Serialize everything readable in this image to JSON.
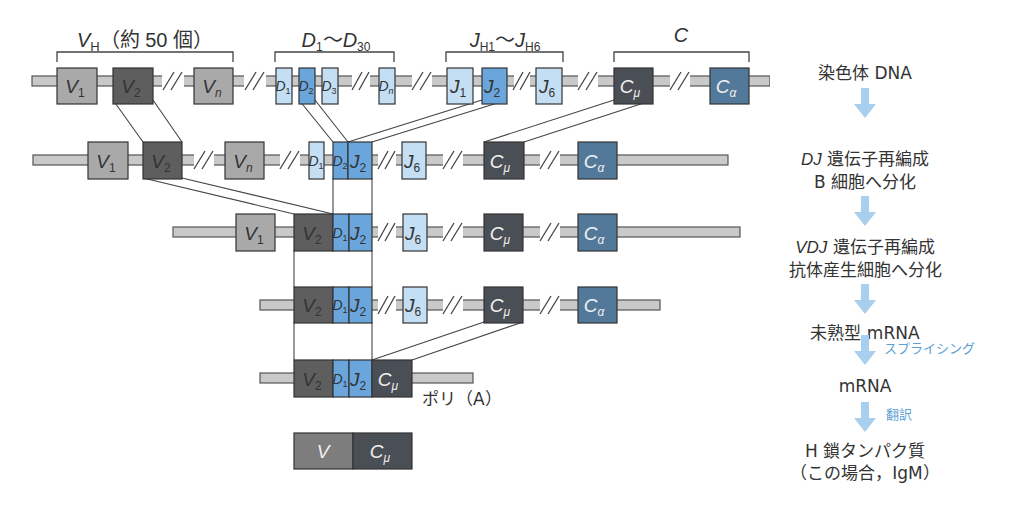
{
  "figure": {
    "type": "immunoglobulin heavy chain gene rearrangement diagram",
    "colors": {
      "bar": "#c9c9c9",
      "bar_stroke": "#555555",
      "v_light": "#a9a9a9",
      "v_dark": "#5e5e5e",
      "d_light": "#c4def4",
      "d_dark": "#6aa6dc",
      "j_light": "#c4def4",
      "j_dark": "#6aa6dc",
      "c_mu": "#4a4f56",
      "c_alpha": "#53799a",
      "arrow": "#a8cfee",
      "note_text": "#5b9fd4",
      "line": "#444444"
    },
    "group_labels": {
      "vh": {
        "main": "V",
        "sub": "H",
        "suffix": "（約 50 個）"
      },
      "d": {
        "text": "D₁〜D₃₀"
      },
      "jh": {
        "text": "J H1〜J H6",
        "main1": "J",
        "sub1": "H1",
        "tilde": "〜",
        "main2": "J",
        "sub2": "H6"
      },
      "c": {
        "text": "C"
      }
    },
    "segments": {
      "V1": "V₁",
      "V2": "V₂",
      "Vn": "Vₙ",
      "D1": "D₁",
      "D2": "D₂",
      "D3": "D₃",
      "Dn": "Dₙ",
      "J1": "J₁",
      "J2": "J₂",
      "J6": "J₆",
      "Cmu": "Cμ",
      "Calpha": "Cα",
      "V": "V"
    },
    "polyA_label": "ポリ（A）"
  },
  "flow": {
    "steps": [
      {
        "id": "chromosome",
        "lines": [
          "染色体 DNA"
        ]
      },
      {
        "id": "dj",
        "italic": "DJ",
        "lines": [
          " 遺伝子再編成",
          "B 細胞へ分化"
        ]
      },
      {
        "id": "vdj",
        "italic": "VDJ",
        "lines": [
          " 遺伝子再編成",
          "抗体産生細胞へ分化"
        ]
      },
      {
        "id": "pre-mrna",
        "lines": [
          "未熟型 mRNA"
        ]
      },
      {
        "id": "mrna",
        "lines": [
          "mRNA"
        ]
      },
      {
        "id": "protein",
        "lines": [
          "H 鎖タンパク質",
          "（この場合，IgM）"
        ]
      }
    ],
    "notes": {
      "splicing": "スプライシング",
      "translation": "翻訳"
    }
  }
}
